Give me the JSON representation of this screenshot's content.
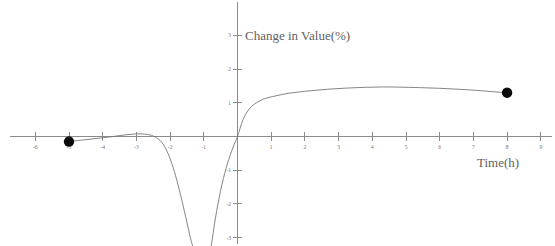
{
  "chart_data": {
    "type": "line",
    "title": "",
    "xlabel": "Time(h)",
    "ylabel": "Change in Value(%)",
    "xlim": [
      -6.7,
      9.6
    ],
    "ylim": [
      -3.2,
      3.3
    ],
    "grid": false,
    "legend": "none",
    "xticks": [
      -6,
      -5,
      -4,
      -3,
      -2,
      -1,
      1,
      2,
      3,
      4,
      5,
      6,
      7,
      8,
      9
    ],
    "xtick_labels": [
      "-6",
      "-5",
      "-4",
      "-3",
      "-2",
      "-1",
      "1",
      "2",
      "3",
      "4",
      "5",
      "6",
      "7",
      "8",
      "9"
    ],
    "yticks": [
      -3,
      -2,
      -1,
      1,
      2,
      3
    ],
    "ytick_labels": [
      "-3",
      "-2",
      "-1",
      "-1",
      "2",
      "3"
    ],
    "ytick_labels_display": [
      "-3",
      "-2",
      "-1",
      "1",
      "2",
      "3"
    ],
    "axis_color": "#8c8c8c",
    "curve_color": "#767676",
    "marker_color": "#0a0a0a",
    "series": [
      {
        "name": "left-branch",
        "comment": "rises from endpoint dot at (-5,-0.15) to local max near (-3,0.08) then plunges steeply below -3",
        "points": [
          [
            -5.0,
            -0.15
          ],
          [
            -4.6,
            -0.105
          ],
          [
            -4.2,
            -0.06
          ],
          [
            -3.8,
            -0.015
          ],
          [
            -3.4,
            0.04
          ],
          [
            -3.0,
            0.075
          ],
          [
            -2.75,
            0.07
          ],
          [
            -2.55,
            0.035
          ],
          [
            -2.4,
            -0.04
          ],
          [
            -2.25,
            -0.17
          ],
          [
            -2.1,
            -0.42
          ],
          [
            -1.95,
            -0.8
          ],
          [
            -1.8,
            -1.3
          ],
          [
            -1.65,
            -1.9
          ],
          [
            -1.5,
            -2.55
          ],
          [
            -1.4,
            -3.0
          ],
          [
            -1.33,
            -3.25
          ]
        ]
      },
      {
        "name": "middle-branch",
        "comment": "returns from below the bottom edge near x=-0.75, climbs steeply through the origin region",
        "points": [
          [
            -0.78,
            -3.25
          ],
          [
            -0.72,
            -2.85
          ],
          [
            -0.66,
            -2.45
          ],
          [
            -0.58,
            -2.0
          ],
          [
            -0.5,
            -1.6
          ],
          [
            -0.42,
            -1.25
          ],
          [
            -0.34,
            -0.95
          ],
          [
            -0.26,
            -0.68
          ],
          [
            -0.18,
            -0.45
          ],
          [
            -0.1,
            -0.24
          ],
          [
            -0.02,
            -0.05
          ],
          [
            0.04,
            0.12
          ]
        ]
      },
      {
        "name": "right-branch",
        "comment": "rises sharply from near origin, peaks about 1.47 near x=4.2, eases down to endpoint dot at (8,1.30)",
        "points": [
          [
            0.04,
            0.12
          ],
          [
            0.12,
            0.38
          ],
          [
            0.22,
            0.62
          ],
          [
            0.35,
            0.82
          ],
          [
            0.5,
            0.96
          ],
          [
            0.7,
            1.08
          ],
          [
            0.9,
            1.15
          ],
          [
            1.2,
            1.22
          ],
          [
            1.5,
            1.28
          ],
          [
            1.9,
            1.33
          ],
          [
            2.3,
            1.37
          ],
          [
            2.8,
            1.41
          ],
          [
            3.3,
            1.44
          ],
          [
            3.8,
            1.46
          ],
          [
            4.3,
            1.47
          ],
          [
            4.8,
            1.465
          ],
          [
            5.4,
            1.45
          ],
          [
            6.0,
            1.43
          ],
          [
            6.6,
            1.4
          ],
          [
            7.2,
            1.36
          ],
          [
            7.7,
            1.32
          ],
          [
            8.0,
            1.3
          ]
        ]
      }
    ],
    "markers": [
      {
        "name": "left-endpoint",
        "x": -5.0,
        "y": -0.15
      },
      {
        "name": "right-endpoint",
        "x": 8.0,
        "y": 1.3
      }
    ]
  }
}
